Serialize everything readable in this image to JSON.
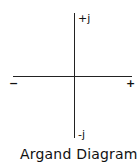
{
  "diagram": {
    "title": "Argand Diagram",
    "axes": {
      "positive_imaginary_label": "+j",
      "negative_imaginary_label": "-j",
      "negative_real_label": "−",
      "positive_real_label": "+"
    },
    "colors": {
      "line": "#222222",
      "text": "#111111",
      "background": "#ffffff"
    }
  }
}
